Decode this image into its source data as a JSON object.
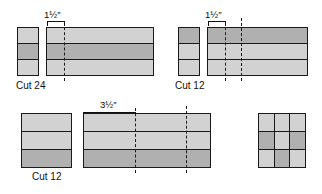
{
  "figure": {
    "type": "quilting-strip-piecing-cutting-diagram",
    "background_color": "#ffffff",
    "line_color": "#1a1a1a",
    "fabric_light_color": "#d2d2d2",
    "fabric_dark_color": "#b0b0b0",
    "cut_line_style": "dashed"
  },
  "groups": [
    {
      "id": "group-a",
      "cut_label": "Cut 24",
      "measurement": "1½″",
      "segment_stack": {
        "bands": [
          "light",
          "dark",
          "light"
        ]
      },
      "strip_set": {
        "bands": [
          "light",
          "dark",
          "light"
        ],
        "cut_lines": 1
      }
    },
    {
      "id": "group-b",
      "cut_label": "Cut 12",
      "measurement": "1½″",
      "segment_stack": {
        "bands": [
          "dark",
          "light",
          "light"
        ]
      },
      "strip_set": {
        "bands": [
          "dark",
          "light",
          "light"
        ],
        "cut_lines": 2
      }
    },
    {
      "id": "group-c",
      "cut_label": "Cut 12",
      "measurement": "3½″",
      "segment_stack": {
        "bands": [
          "light",
          "light",
          "dark"
        ]
      },
      "strip_set": {
        "bands": [
          "light",
          "light",
          "dark"
        ],
        "cut_lines": 2
      }
    }
  ],
  "nine_patch": {
    "id": "finished-block",
    "rows": [
      [
        "light",
        "light",
        "light"
      ],
      [
        "dark",
        "light",
        "dark"
      ],
      [
        "light",
        "dark",
        "light"
      ]
    ]
  }
}
